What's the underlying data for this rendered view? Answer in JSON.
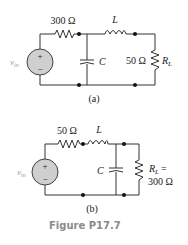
{
  "figure": {
    "caption": "Figure P17.7",
    "circuits": [
      {
        "label": "(a)",
        "source": {
          "name": "v_in",
          "symbol": "v",
          "subscript": "in",
          "plus": "+",
          "minus": "−"
        },
        "components": [
          {
            "type": "resistor",
            "value": "300 Ω"
          },
          {
            "type": "capacitor",
            "name": "C"
          },
          {
            "type": "inductor",
            "name": "L"
          },
          {
            "type": "resistor",
            "value": "50 Ω",
            "name": "R",
            "subscript": "L"
          }
        ]
      },
      {
        "label": "(b)",
        "source": {
          "name": "v_in",
          "symbol": "v",
          "subscript": "in",
          "plus": "+",
          "minus": "−"
        },
        "components": [
          {
            "type": "resistor",
            "value": "50 Ω"
          },
          {
            "type": "inductor",
            "name": "L"
          },
          {
            "type": "capacitor",
            "name": "C"
          },
          {
            "type": "resistor",
            "name": "R",
            "subscript": "L",
            "equals": "=",
            "value": "300 Ω"
          }
        ]
      }
    ]
  }
}
